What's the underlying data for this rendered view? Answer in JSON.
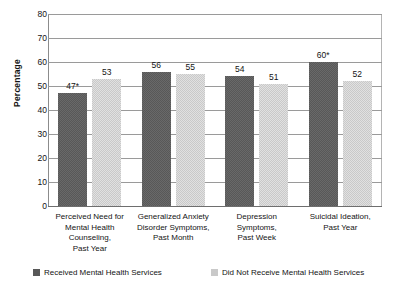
{
  "chart_data": {
    "type": "bar",
    "title": "",
    "xlabel": "",
    "ylabel": "Percentage",
    "ylim": [
      0,
      80
    ],
    "y_ticks": [
      0,
      10,
      20,
      30,
      40,
      50,
      60,
      70,
      80
    ],
    "grid": true,
    "legend_position": "bottom",
    "categories": [
      "Perceived Need for\nMental Health\nCounseling,\nPast Year",
      "Generalized Anxiety\nDisorder Symptoms,\nPast Month",
      "Depression\nSymptoms,\nPast Week",
      "Suicidal Ideation,\nPast Year"
    ],
    "category_lines": [
      [
        "Perceived Need for",
        "Mental Health",
        "Counseling,",
        "Past Year"
      ],
      [
        "Generalized Anxiety",
        "Disorder Symptoms,",
        "Past Month"
      ],
      [
        "Depression",
        "Symptoms,",
        "Past Week"
      ],
      [
        "Suicidal Ideation,",
        "Past Year"
      ]
    ],
    "series": [
      {
        "name": "Received Mental Health Services",
        "color": "#585858",
        "values": [
          47,
          56,
          54,
          60
        ],
        "labels": [
          "47*",
          "56",
          "54",
          "60*"
        ]
      },
      {
        "name": "Did Not Receive Mental Health Services",
        "color": "#c9c9c9",
        "values": [
          53,
          55,
          51,
          52
        ],
        "labels": [
          "53",
          "55",
          "51",
          "52"
        ]
      }
    ],
    "annotations": [
      "* denotes statistically significant value"
    ]
  },
  "axis": {
    "y_title": "Percentage",
    "y_tick_labels": [
      "0",
      "10",
      "20",
      "30",
      "40",
      "50",
      "60",
      "70",
      "80"
    ]
  },
  "legend": {
    "items": [
      {
        "label": "Received Mental Health Services",
        "color": "#585858"
      },
      {
        "label": "Did Not Receive Mental Health Services",
        "color": "#c9c9c9"
      }
    ]
  }
}
